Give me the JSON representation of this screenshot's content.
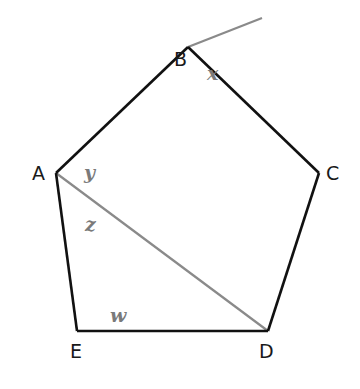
{
  "diagram": {
    "colors": {
      "edge": "#111111",
      "auxiliary": "#8a8a8a",
      "vertex_label": "#1a1a1a",
      "angle_label": "#7a7a7a"
    },
    "vertices": [
      {
        "id": "A",
        "label": "A"
      },
      {
        "id": "B",
        "label": "B"
      },
      {
        "id": "C",
        "label": "C"
      },
      {
        "id": "D",
        "label": "D"
      },
      {
        "id": "E",
        "label": "E"
      }
    ],
    "angles": [
      {
        "id": "x",
        "label": "x",
        "at": "B",
        "description": "exterior angle between extension of AB and BC"
      },
      {
        "id": "y",
        "label": "y",
        "at": "A",
        "description": "angle BAD"
      },
      {
        "id": "z",
        "label": "z",
        "at": "A",
        "description": "angle DAE"
      },
      {
        "id": "w",
        "label": "w",
        "at": "E",
        "description": "interior angle AED"
      }
    ],
    "segments": [
      {
        "from": "A",
        "to": "B",
        "style": "edge"
      },
      {
        "from": "B",
        "to": "C",
        "style": "edge"
      },
      {
        "from": "C",
        "to": "D",
        "style": "edge"
      },
      {
        "from": "D",
        "to": "E",
        "style": "edge"
      },
      {
        "from": "E",
        "to": "A",
        "style": "edge"
      },
      {
        "from": "A",
        "to": "D",
        "style": "auxiliary"
      },
      {
        "from": "B",
        "to": "extension",
        "style": "auxiliary"
      }
    ]
  }
}
